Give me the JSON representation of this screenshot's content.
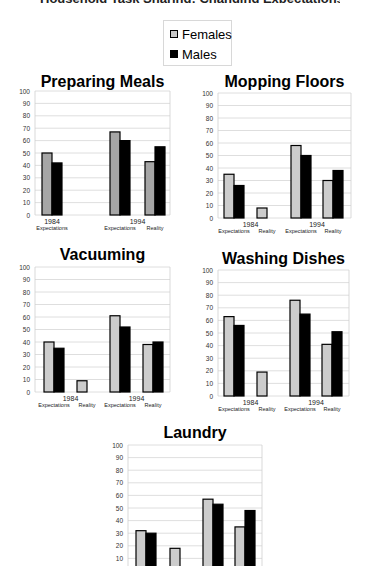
{
  "page": {
    "partial_title": "Household Task Sharing: Changing Expectations"
  },
  "legend": {
    "items": [
      {
        "label": "Females",
        "color": "#c8c8c8"
      },
      {
        "label": "Males",
        "color": "#000000"
      }
    ]
  },
  "chart_data": [
    {
      "type": "bar",
      "title": "Preparing Meals",
      "groups": [
        {
          "year": "1984",
          "categories": [
            "Expectations"
          ]
        },
        {
          "year": "1994",
          "categories": [
            "Expectations",
            "Reality"
          ]
        }
      ],
      "categories": [
        "1984 Expectations",
        "1994 Expectations",
        "1994 Reality"
      ],
      "series": [
        {
          "name": "Females",
          "values": [
            50,
            67,
            43
          ]
        },
        {
          "name": "Males",
          "values": [
            42,
            60,
            55
          ]
        }
      ],
      "yticks": [
        0,
        10,
        20,
        30,
        40,
        50,
        60,
        70,
        80,
        90,
        100
      ],
      "ylim": [
        0,
        100
      ],
      "grid": true,
      "xlabel": "",
      "ylabel": ""
    },
    {
      "type": "bar",
      "title": "Mopping Floors",
      "groups": [
        {
          "year": "1984",
          "categories": [
            "Expectations",
            "Reality"
          ]
        },
        {
          "year": "1994",
          "categories": [
            "Expectations",
            "Reality"
          ]
        }
      ],
      "categories": [
        "1984 Expectations",
        "1984 Reality",
        "1994 Expectations",
        "1994 Reality"
      ],
      "series": [
        {
          "name": "Females",
          "values": [
            35,
            8,
            58,
            30
          ]
        },
        {
          "name": "Males",
          "values": [
            26,
            null,
            50,
            38
          ]
        }
      ],
      "yticks": [
        0,
        10,
        20,
        30,
        40,
        50,
        60,
        70,
        80,
        90,
        100
      ],
      "ylim": [
        0,
        100
      ],
      "grid": true,
      "xlabel": "",
      "ylabel": ""
    },
    {
      "type": "bar",
      "title": "Vacuuming",
      "groups": [
        {
          "year": "1984",
          "categories": [
            "Expectations",
            "Reality"
          ]
        },
        {
          "year": "1994",
          "categories": [
            "Expectations",
            "Reality"
          ]
        }
      ],
      "categories": [
        "1984 Expectations",
        "1984 Reality",
        "1994 Expectations",
        "1994 Reality"
      ],
      "series": [
        {
          "name": "Females",
          "values": [
            40,
            9,
            61,
            38
          ]
        },
        {
          "name": "Males",
          "values": [
            35,
            null,
            52,
            40
          ]
        }
      ],
      "yticks": [
        0,
        10,
        20,
        30,
        40,
        50,
        60,
        70,
        80,
        90,
        100
      ],
      "ylim": [
        0,
        100
      ],
      "grid": true,
      "xlabel": "",
      "ylabel": ""
    },
    {
      "type": "bar",
      "title": "Washing Dishes",
      "groups": [
        {
          "year": "1984",
          "categories": [
            "Expectations",
            "Reality"
          ]
        },
        {
          "year": "1994",
          "categories": [
            "Expectations",
            "Reality"
          ]
        }
      ],
      "categories": [
        "1984 Expectations",
        "1984 Reality",
        "1994 Expectations",
        "1994 Reality"
      ],
      "series": [
        {
          "name": "Females",
          "values": [
            63,
            19,
            76,
            41
          ]
        },
        {
          "name": "Males",
          "values": [
            56,
            null,
            65,
            51
          ]
        }
      ],
      "yticks": [
        0,
        10,
        20,
        30,
        40,
        50,
        60,
        70,
        80,
        90,
        100
      ],
      "ylim": [
        0,
        100
      ],
      "grid": true,
      "xlabel": "",
      "ylabel": ""
    },
    {
      "type": "bar",
      "title": "Laundry",
      "groups": [
        {
          "year": "1984",
          "categories": [
            "Expectations",
            "Reality"
          ]
        },
        {
          "year": "1994",
          "categories": [
            "Expectations",
            "Reality"
          ]
        }
      ],
      "categories": [
        "1984 Expectations",
        "1984 Reality",
        "1994 Expectations",
        "1994 Reality"
      ],
      "series": [
        {
          "name": "Females",
          "values": [
            32,
            18,
            57,
            35
          ]
        },
        {
          "name": "Males",
          "values": [
            30,
            null,
            53,
            48
          ]
        }
      ],
      "yticks": [
        10,
        20,
        30,
        40,
        50,
        60,
        70,
        80,
        90,
        100
      ],
      "ylim": [
        0,
        100
      ],
      "grid": true,
      "xlabel": "",
      "ylabel": ""
    }
  ]
}
